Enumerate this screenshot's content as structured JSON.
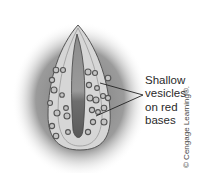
{
  "figure": {
    "colors": {
      "background_halo": "#8a8a8a",
      "skin": "#d8d8d8",
      "fold": "#9a9a9a",
      "line": "#222222",
      "vesicle": "#bdbdbd"
    }
  },
  "annotation": {
    "lines": [
      "Shallow",
      "vesicles",
      "on red",
      "bases"
    ]
  },
  "credit": {
    "text": "© Cengage Learning®."
  }
}
